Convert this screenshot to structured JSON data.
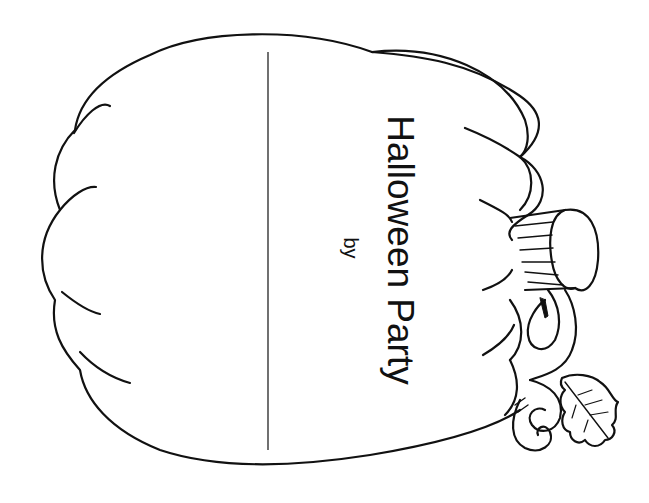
{
  "page": {
    "title": "Halloween Party",
    "byline": "by"
  },
  "colors": {
    "background": "#ffffff",
    "ink": "#111111"
  },
  "illustration": {
    "subject": "pumpkin",
    "orientation": "rotated-90",
    "elements": [
      "pumpkin-outline",
      "pumpkin-ribs",
      "writing-line",
      "stem",
      "vine",
      "leaf"
    ]
  }
}
